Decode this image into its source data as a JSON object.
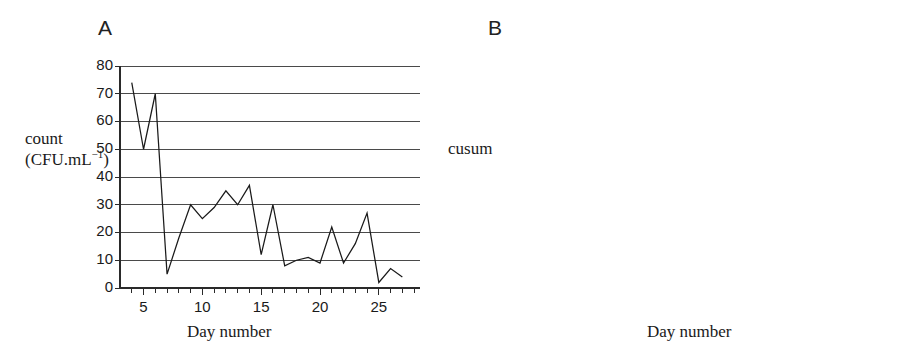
{
  "figure": {
    "panels": [
      {
        "letter": "A",
        "ylabel_line1": "count",
        "ylabel_line2_pre": "(CFU.mL",
        "ylabel_line2_sup": "−1",
        "ylabel_line2_post": ")",
        "xlabel": "Day number"
      },
      {
        "letter": "B",
        "ylabel_line1": "cusum",
        "xlabel": "Day number"
      }
    ]
  },
  "chart_data": [
    {
      "type": "line",
      "panel": "A",
      "title": "",
      "xlabel": "Day number",
      "ylabel": "count (CFU.mL−1)",
      "xlim": [
        3,
        28.5
      ],
      "ylim": [
        0,
        80
      ],
      "yticks": [
        0,
        10,
        20,
        30,
        40,
        50,
        60,
        70,
        80
      ],
      "ytick_labels": [
        "0",
        "10",
        "20",
        "30",
        "40",
        "50",
        "60",
        "70",
        "80"
      ],
      "xticks": [
        4,
        5,
        6,
        7,
        8,
        9,
        10,
        11,
        12,
        13,
        14,
        15,
        16,
        17,
        18,
        19,
        20,
        21,
        22,
        23,
        24,
        25,
        26,
        27,
        28
      ],
      "xtick_labeled": [
        5,
        10,
        15,
        20,
        25
      ],
      "xtick_labels": [
        "5",
        "10",
        "15",
        "20",
        "25"
      ],
      "grid": "horizontal",
      "legend": "none",
      "x": [
        4,
        5,
        6,
        7,
        8,
        9,
        10,
        11,
        12,
        13,
        14,
        15,
        16,
        17,
        18,
        19,
        20,
        21,
        22,
        23,
        24,
        25,
        26,
        27
      ],
      "values": [
        74,
        50,
        70,
        5,
        18,
        30,
        25,
        29,
        35,
        30,
        37,
        12,
        30,
        8,
        10,
        11,
        9,
        22,
        9,
        16,
        27,
        2,
        7,
        4
      ]
    },
    {
      "type": "line",
      "panel": "B",
      "title": "",
      "xlabel": "Day number",
      "ylabel": "cusum",
      "xlim": [
        3,
        25.5
      ],
      "ylim": [
        0,
        200
      ],
      "yticks": [
        0,
        20,
        40,
        60,
        80,
        100,
        120,
        140,
        160,
        180,
        200
      ],
      "ytick_labels": [
        "0",
        "20",
        "40",
        "60",
        "80",
        "100",
        "120",
        "140",
        "160",
        "180",
        "200"
      ],
      "xticks": [
        4,
        5,
        6,
        7,
        8,
        9,
        10,
        11,
        12,
        13,
        14,
        15,
        16,
        17,
        18,
        19,
        20,
        21,
        22,
        23,
        24,
        25
      ],
      "xtick_labeled": [
        5,
        10,
        15,
        20,
        25
      ],
      "xtick_labels": [
        "5",
        "10",
        "15",
        "20",
        "25"
      ],
      "grid": "horizontal",
      "legend": "none",
      "x": [
        4,
        5,
        6,
        7,
        8,
        9,
        10,
        11,
        12,
        13,
        14,
        15,
        16,
        17,
        18,
        19,
        20,
        21,
        22,
        23,
        24
      ],
      "values": [
        45,
        102,
        160,
        140,
        141,
        143,
        141,
        140,
        170,
        165,
        159,
        170,
        180,
        148,
        121,
        120,
        118,
        114,
        116,
        117,
        0
      ]
    }
  ]
}
